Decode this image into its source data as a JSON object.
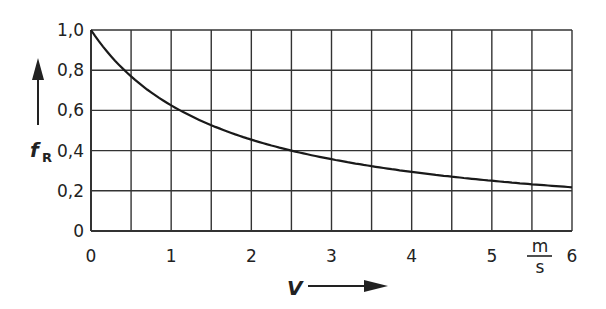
{
  "chart_data": {
    "type": "line",
    "title": "",
    "xlabel": "V",
    "xunit_num": "m",
    "xunit_den": "s",
    "ylabel": "f",
    "ylabel_sub": "R",
    "xlim": [
      0,
      6
    ],
    "ylim": [
      0,
      1.0
    ],
    "x_ticks": [
      "0",
      "1",
      "2",
      "3",
      "4",
      "5",
      "6"
    ],
    "y_ticks": [
      "0",
      "0,2",
      "0,4",
      "0,6",
      "0,8",
      "1,0"
    ],
    "grid": true,
    "x_grid_step": 0.5,
    "y_grid_step": 0.2,
    "series": [
      {
        "name": "f_R",
        "x": [
          0,
          0.25,
          0.5,
          0.75,
          1,
          1.5,
          2,
          2.5,
          3,
          3.5,
          4,
          4.5,
          5,
          5.5,
          6
        ],
        "values": [
          1.0,
          0.87,
          0.77,
          0.69,
          0.62,
          0.52,
          0.44,
          0.39,
          0.35,
          0.32,
          0.29,
          0.27,
          0.25,
          0.23,
          0.22
        ]
      }
    ]
  }
}
